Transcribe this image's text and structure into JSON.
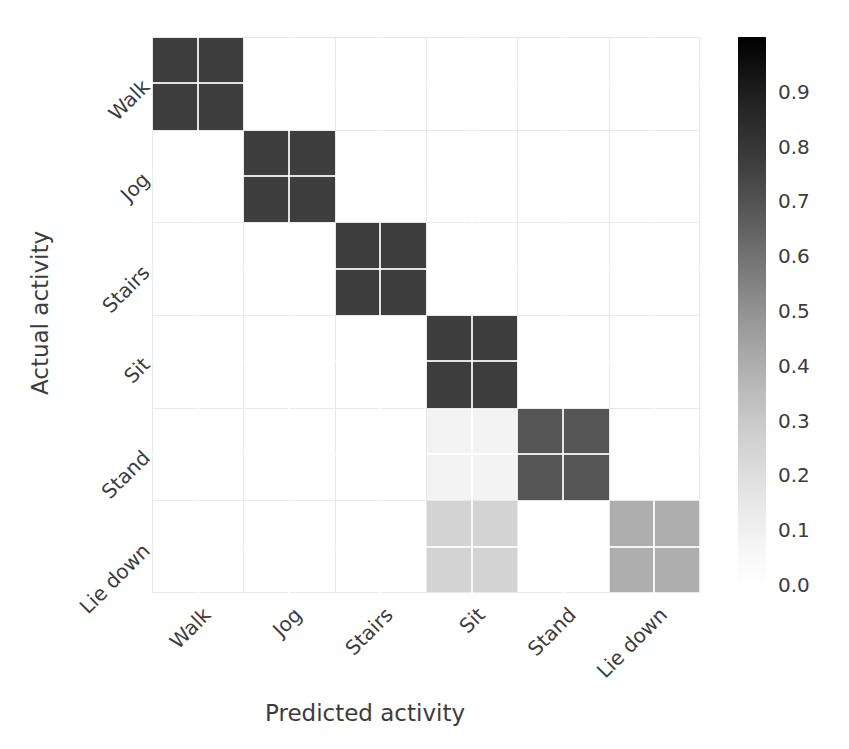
{
  "figure": {
    "type": "confusion-matrix-heatmap",
    "background": "#ffffff",
    "text_color": "#3c3c3c",
    "grid_color": "#e9e9e9"
  },
  "axes": {
    "xlabel": "Predicted activity",
    "ylabel": "Actual activity"
  },
  "colorbar": {
    "ticks": [
      "0.9",
      "0.8",
      "0.7",
      "0.6",
      "0.5",
      "0.4",
      "0.3",
      "0.2",
      "0.1",
      "0.0"
    ],
    "tick_values": [
      0.9,
      0.8,
      0.7,
      0.6,
      0.5,
      0.4,
      0.3,
      0.2,
      0.1,
      0.0
    ],
    "vmin": 0.0,
    "vmax": 1.0,
    "colormap": "Greys",
    "orientation": "vertical",
    "high_color": "#000000",
    "low_color": "#ffffff"
  },
  "chart_data": {
    "type": "heatmap",
    "title": "",
    "xlabel": "Predicted activity",
    "ylabel": "Actual activity",
    "categories": [
      "Walk",
      "Jog",
      "Stairs",
      "Sit",
      "Stand",
      "Lie down"
    ],
    "x_tick_labels": [
      "Walk",
      "Jog",
      "Stairs",
      "Sit",
      "Stand",
      "Lie down"
    ],
    "y_tick_labels": [
      "Walk",
      "Jog",
      "Stairs",
      "Sit",
      "Stand",
      "Lie down"
    ],
    "row_labels": [
      "Walk",
      "Jog",
      "Stairs",
      "Sit",
      "Stand",
      "Lie down"
    ],
    "col_labels": [
      "Walk",
      "Jog",
      "Stairs",
      "Sit",
      "Stand",
      "Lie down"
    ],
    "zlim": [
      0.0,
      1.0
    ],
    "grid": true,
    "legend": "colorbar-right",
    "values": [
      [
        0.97,
        0.0,
        0.0,
        0.0,
        0.0,
        0.0
      ],
      [
        0.0,
        0.97,
        0.0,
        0.0,
        0.0,
        0.0
      ],
      [
        0.0,
        0.0,
        0.97,
        0.0,
        0.0,
        0.0
      ],
      [
        0.0,
        0.0,
        0.0,
        0.97,
        0.0,
        0.0
      ],
      [
        0.0,
        0.0,
        0.0,
        0.07,
        0.85,
        0.0
      ],
      [
        0.0,
        0.0,
        0.0,
        0.28,
        0.0,
        0.42
      ]
    ],
    "cell_colors": [
      [
        "#3e3e3e",
        "#ffffff",
        "#ffffff",
        "#ffffff",
        "#ffffff",
        "#ffffff"
      ],
      [
        "#ffffff",
        "#3e3e3e",
        "#ffffff",
        "#ffffff",
        "#ffffff",
        "#ffffff"
      ],
      [
        "#ffffff",
        "#ffffff",
        "#3e3e3e",
        "#ffffff",
        "#ffffff",
        "#ffffff"
      ],
      [
        "#ffffff",
        "#ffffff",
        "#ffffff",
        "#3e3e3e",
        "#ffffff",
        "#ffffff"
      ],
      [
        "#ffffff",
        "#ffffff",
        "#ffffff",
        "#f3f3f3",
        "#555555",
        "#ffffff"
      ],
      [
        "#ffffff",
        "#ffffff",
        "#ffffff",
        "#d3d3d3",
        "#ffffff",
        "#aeaeae"
      ]
    ]
  }
}
